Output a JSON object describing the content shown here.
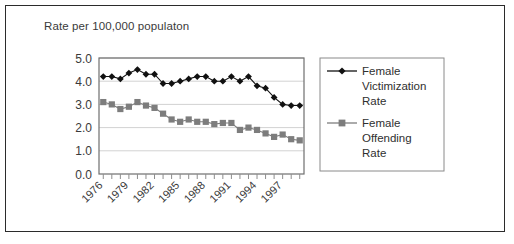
{
  "figure": {
    "title": "Rate per 100,000 populaton",
    "border_color": "#2b2b2b",
    "background": "#ffffff"
  },
  "chart_data": {
    "type": "line",
    "title": "Rate per 100,000 populaton",
    "xlabel": "",
    "ylabel": "",
    "ylim": [
      0.0,
      5.0
    ],
    "ytick_labels": [
      "0.0",
      "1.0",
      "2.0",
      "3.0",
      "4.0",
      "5.0"
    ],
    "ytick_values": [
      0.0,
      1.0,
      2.0,
      3.0,
      4.0,
      5.0
    ],
    "grid": true,
    "grid_axis": "y",
    "legend_position": "right",
    "x": [
      1976,
      1977,
      1978,
      1979,
      1980,
      1981,
      1982,
      1983,
      1984,
      1985,
      1986,
      1987,
      1988,
      1989,
      1990,
      1991,
      1992,
      1993,
      1994,
      1995,
      1996,
      1997,
      1998,
      1999
    ],
    "xtick_labels": [
      "1976",
      "1979",
      "1982",
      "1985",
      "1988",
      "1991",
      "1994",
      "1997"
    ],
    "xtick_label_values": [
      1976,
      1979,
      1982,
      1985,
      1988,
      1991,
      1994,
      1997
    ],
    "xtick_rotation": 45,
    "series": [
      {
        "name": "Female Victimization Rate",
        "legend_label": "Female Victimization Rate",
        "marker": "diamond",
        "color": "#111111",
        "values": [
          4.2,
          4.2,
          4.1,
          4.35,
          4.5,
          4.3,
          4.3,
          3.9,
          3.9,
          4.0,
          4.1,
          4.2,
          4.2,
          4.0,
          4.0,
          4.2,
          4.0,
          4.2,
          3.8,
          3.7,
          3.3,
          3.0,
          2.95,
          2.95
        ]
      },
      {
        "name": "Female Offending Rate",
        "legend_label": "Female Offending Rate",
        "marker": "square",
        "color": "#7d7d7d",
        "values": [
          3.1,
          3.0,
          2.8,
          2.9,
          3.1,
          2.95,
          2.85,
          2.6,
          2.35,
          2.25,
          2.35,
          2.25,
          2.25,
          2.15,
          2.2,
          2.2,
          1.9,
          2.0,
          1.9,
          1.75,
          1.6,
          1.7,
          1.5,
          1.45
        ]
      }
    ]
  },
  "legend": {
    "entries": [
      {
        "label_lines": [
          "Female",
          "Victimization",
          "Rate"
        ],
        "marker": "diamond",
        "color": "#111111"
      },
      {
        "label_lines": [
          "Female",
          "Offending",
          "Rate"
        ],
        "marker": "square",
        "color": "#7d7d7d"
      }
    ]
  }
}
